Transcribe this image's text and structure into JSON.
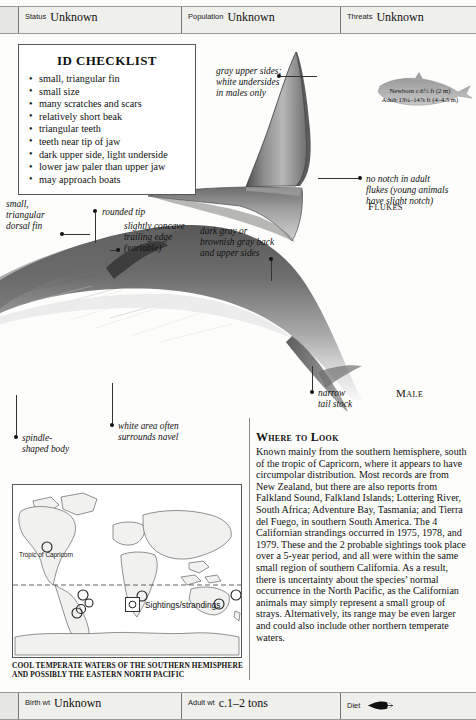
{
  "top_bar": {
    "fields": [
      {
        "key": "Status",
        "value": "Unknown"
      },
      {
        "key": "Population",
        "value": "Unknown"
      },
      {
        "key": "Threats",
        "value": "Unknown"
      }
    ]
  },
  "bottom_bar": {
    "fields": [
      {
        "key": "Birth wt",
        "value": "Unknown"
      },
      {
        "key": "Adult wt",
        "value": "c.1–2 tons"
      },
      {
        "key": "Diet",
        "value": "",
        "icon": "fish-icon"
      }
    ]
  },
  "checklist": {
    "title": "ID CHECKLIST",
    "items": [
      "small, triangular fin",
      "small size",
      "many scratches and scars",
      "relatively short beak",
      "triangular teeth",
      "teeth near tip of jaw",
      "dark upper side, light underside",
      "lower jaw paler than upper jaw",
      "may approach boats"
    ]
  },
  "size_note": {
    "newborn": "Newborn c.6½ ft (2 m)",
    "adult": "Adult 13¼–14⅞ ft (4–4.5 m)"
  },
  "callouts": {
    "gray_upper": "gray upper sides;\nwhite undersides\nin males only",
    "no_notch": "no notch in adult\nflukes (young animals\nhave slight notch)",
    "flukes_label": "Flukes",
    "male_label": "Male",
    "small_tri_fin": "small,\ntriangular\ndorsal fin",
    "rounded_tip": "rounded tip",
    "trailing_edge": "slightly concave\ntrailing edge\n(variable)",
    "dark_gray": "dark gray or\nbrownish gray back\nand upper sides",
    "narrow_tail": "narrow\ntail stock",
    "white_area": "white area often\nsurrounds navel",
    "spindle": "spindle-\nshaped body"
  },
  "where_to_look": {
    "heading": "Where to Look",
    "body": "Known mainly from the southern hemisphere, south of the tropic of Capricorn, where it appears to have circumpolar distribution. Most records are from New Zealand, but there are also reports from Falkland Sound, Falkland Islands; Lottering River, South Africa; Adventure Bay, Tasmania; and Tierra del Fuego, in southern South America. The 4 Californian strandings occurred in 1975, 1978, and 1979. These and the 2 probable sightings took place over a 5-year period, and all were within the same small region of southern California. As a result, there is uncertainty about the species’ normal occurrence in the North Pacific, as the Californian animals may simply represent a small group of strays. Alternatively, its range may be even larger and could also include other northern temperate waters."
  },
  "map": {
    "tropic_label": "Tropic of Capricorn",
    "legend_label": "Sightings/strandings",
    "caption": "COOL TEMPERATE WATERS OF THE SOUTHERN HEMISPHERE AND POSSIBLY THE  EASTERN NORTH PACIFIC"
  },
  "colors": {
    "bar_bg": "#efefec",
    "rule": "#777777",
    "whale_dark": "#4a4a4a",
    "whale_mid": "#8d8d8d",
    "whale_light": "#cfcfcf",
    "map_land": "#f0f0ee",
    "ink": "#111111"
  }
}
